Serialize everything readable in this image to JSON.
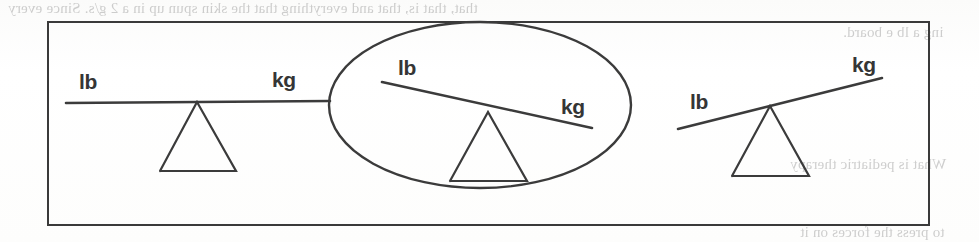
{
  "document": {
    "type": "scanned-book-page-figure",
    "caption_text": "",
    "ghost_text": [
      {
        "id": "ghost-top-left",
        "text": "that, that is, that and everything that the skin spun up in a 2 g/s. Since every",
        "x": 8,
        "y": 2,
        "size": 15
      },
      {
        "id": "ghost-top-right",
        "text": "ing a lb e board.",
        "x": 843,
        "y": 26,
        "size": 15
      },
      {
        "id": "ghost-mid-right",
        "text": "",
        "x": 900,
        "y": 100,
        "size": 14
      },
      {
        "id": "ghost-low-right",
        "text": "What is pediatric therapy",
        "x": 790,
        "y": 158,
        "size": 15
      },
      {
        "id": "ghost-bottom",
        "text": "to press the forces on it",
        "x": 800,
        "y": 226,
        "size": 15
      }
    ]
  },
  "figure": {
    "name": "three-balance-scales-diagram",
    "border_color": "#3a3a3a",
    "ink_color": "#3b3b3b",
    "highlight": {
      "shape": "ellipse",
      "target": "scale-2",
      "cx": 480,
      "cy": 105,
      "rx": 151,
      "ry": 83
    },
    "scales": [
      {
        "id": "scale-1",
        "name": "balanced-scale",
        "state": "balanced",
        "tilt_degrees": 0,
        "left_label": "lb",
        "right_label": "kg",
        "left_label_pos": {
          "x": 79,
          "y": 71
        },
        "right_label_pos": {
          "x": 272,
          "y": 69
        },
        "beam": {
          "x1": 66,
          "y1": 103,
          "x2": 330,
          "y2": 101
        },
        "fulcrum": {
          "apex_x": 197,
          "apex_y": 102,
          "base_left_x": 160,
          "base_right_x": 236,
          "base_y": 171
        }
      },
      {
        "id": "scale-2",
        "name": "kg-heavier-scale",
        "state": "tilted-right",
        "tilt_degrees": 12,
        "left_label": "lb",
        "right_label": "kg",
        "left_label_pos": {
          "x": 398,
          "y": 57
        },
        "right_label_pos": {
          "x": 561,
          "y": 96
        },
        "beam": {
          "x1": 382,
          "y1": 82,
          "x2": 592,
          "y2": 128
        },
        "fulcrum": {
          "apex_x": 488,
          "apex_y": 112,
          "base_left_x": 450,
          "base_right_x": 527,
          "base_y": 181
        }
      },
      {
        "id": "scale-3",
        "name": "lb-heavier-scale",
        "state": "tilted-left",
        "tilt_degrees": -14,
        "left_label": "lb",
        "right_label": "kg",
        "left_label_pos": {
          "x": 690,
          "y": 91
        },
        "right_label_pos": {
          "x": 852,
          "y": 54
        },
        "beam": {
          "x1": 678,
          "y1": 129,
          "x2": 882,
          "y2": 78
        },
        "fulcrum": {
          "apex_x": 770,
          "apex_y": 106,
          "base_left_x": 732,
          "base_right_x": 809,
          "base_y": 176
        }
      }
    ]
  }
}
